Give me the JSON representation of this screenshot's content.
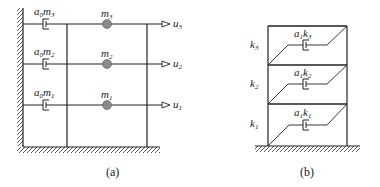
{
  "figure_a": {
    "caption": "(a)",
    "floors": [
      {
        "damper_label_base": "a",
        "damper_label_sub": "0",
        "damper_label_var": "m",
        "damper_label_varsub": "3",
        "mass_label": "m",
        "mass_sub": "3",
        "disp_label": "u",
        "disp_sub": "3"
      },
      {
        "damper_label_base": "a",
        "damper_label_sub": "0",
        "damper_label_var": "m",
        "damper_label_varsub": "2",
        "mass_label": "m",
        "mass_sub": "2",
        "disp_label": "u",
        "disp_sub": "2"
      },
      {
        "damper_label_base": "a",
        "damper_label_sub": "0",
        "damper_label_var": "m",
        "damper_label_varsub": "1",
        "mass_label": "m",
        "mass_sub": "1",
        "disp_label": "u",
        "disp_sub": "1"
      }
    ],
    "mass_color": "#8a8a8a"
  },
  "figure_b": {
    "caption": "(b)",
    "stories": [
      {
        "stiffness_label": "k",
        "stiffness_sub": "3",
        "damper_label_base": "a",
        "damper_label_sub": "1",
        "damper_label_var": "k",
        "damper_label_varsub": "3"
      },
      {
        "stiffness_label": "k",
        "stiffness_sub": "2",
        "damper_label_base": "a",
        "damper_label_sub": "1",
        "damper_label_var": "k",
        "damper_label_varsub": "2"
      },
      {
        "stiffness_label": "k",
        "stiffness_sub": "1",
        "damper_label_base": "a",
        "damper_label_sub": "1",
        "damper_label_var": "k",
        "damper_label_varsub": "1"
      }
    ]
  },
  "colors": {
    "line": "#222222",
    "mass_fill": "#8a8a8a"
  }
}
